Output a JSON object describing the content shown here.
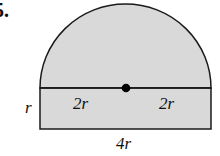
{
  "problem": {
    "number_label": "5."
  },
  "figure": {
    "fill_color": "#d9d9d9",
    "stroke_color": "#1a1a1a",
    "labels": {
      "left_radius": "2r",
      "right_radius": "2r",
      "rect_height": "r",
      "rect_width": "4r"
    }
  }
}
